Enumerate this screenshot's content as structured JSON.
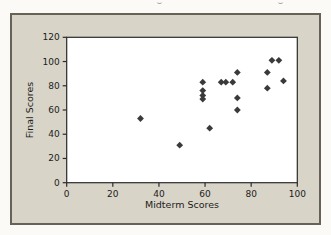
{
  "colors": {
    "page_bg": "#fbfaf7",
    "panel_bg": "#d8d4c8",
    "panel_border": "#666258",
    "plot_bg": "#ffffff",
    "axis": "#2b2b2b",
    "marker": "#3a3a3a",
    "text": "#1c1c1c"
  },
  "chart_data": {
    "type": "scatter",
    "title": "",
    "xlabel": "Midterm Scores",
    "ylabel": "Final Scores",
    "xlim": [
      0,
      100
    ],
    "ylim": [
      0,
      120
    ],
    "x_ticks": [
      0,
      20,
      40,
      60,
      80,
      100
    ],
    "y_ticks": [
      0,
      20,
      40,
      60,
      80,
      100,
      120
    ],
    "grid": false,
    "legend": null,
    "marker": "diamond",
    "points": [
      [
        32,
        53
      ],
      [
        49,
        31
      ],
      [
        62,
        45
      ],
      [
        59,
        83
      ],
      [
        59,
        76
      ],
      [
        59,
        72
      ],
      [
        59,
        69
      ],
      [
        67,
        83
      ],
      [
        69,
        83
      ],
      [
        72,
        83
      ],
      [
        74,
        91
      ],
      [
        74,
        70
      ],
      [
        74,
        60
      ],
      [
        87,
        91
      ],
      [
        87,
        78
      ],
      [
        89,
        101
      ],
      [
        92,
        101
      ],
      [
        94,
        84
      ]
    ]
  }
}
